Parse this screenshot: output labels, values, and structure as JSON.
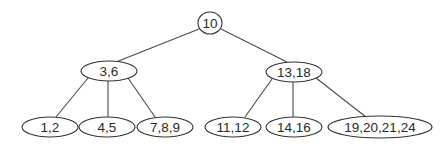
{
  "diagram": {
    "type": "b-tree",
    "colors": {
      "background": "#ffffff",
      "stroke": "#333333",
      "text": "#2a2a2a"
    },
    "nodes": [
      {
        "id": "root",
        "label": "10",
        "shape": "circle",
        "cx": 210,
        "cy": 23,
        "rx": 12,
        "ry": 11
      },
      {
        "id": "n36",
        "label": "3,6",
        "shape": "ellipse",
        "cx": 109,
        "cy": 71,
        "rx": 28,
        "ry": 10
      },
      {
        "id": "n1318",
        "label": "13,18",
        "shape": "ellipse",
        "cx": 294,
        "cy": 72,
        "rx": 28,
        "ry": 10
      },
      {
        "id": "n12",
        "label": "1,2",
        "shape": "ellipse",
        "cx": 50,
        "cy": 127,
        "rx": 28,
        "ry": 10
      },
      {
        "id": "n45",
        "label": "4,5",
        "shape": "ellipse",
        "cx": 107,
        "cy": 127,
        "rx": 28,
        "ry": 10
      },
      {
        "id": "n789",
        "label": "7,8,9",
        "shape": "ellipse",
        "cx": 165,
        "cy": 127,
        "rx": 28,
        "ry": 10
      },
      {
        "id": "n1112",
        "label": "11,12",
        "shape": "ellipse",
        "cx": 233,
        "cy": 127,
        "rx": 28,
        "ry": 10
      },
      {
        "id": "n1416",
        "label": "14,16",
        "shape": "ellipse",
        "cx": 294,
        "cy": 127,
        "rx": 28,
        "ry": 10
      },
      {
        "id": "n19202124",
        "label": "19,20,21,24",
        "shape": "ellipse",
        "cx": 380,
        "cy": 127,
        "rx": 52,
        "ry": 11
      }
    ],
    "edges": [
      {
        "from": "root",
        "to": "n36",
        "x1": 199,
        "y1": 29,
        "x2": 116,
        "y2": 62
      },
      {
        "from": "root",
        "to": "n1318",
        "x1": 221,
        "y1": 29,
        "x2": 287,
        "y2": 62
      },
      {
        "from": "n36",
        "to": "n12",
        "x1": 88,
        "y1": 78,
        "x2": 56,
        "y2": 117
      },
      {
        "from": "n36",
        "to": "n45",
        "x1": 108,
        "y1": 81,
        "x2": 108,
        "y2": 117
      },
      {
        "from": "n36",
        "to": "n789",
        "x1": 128,
        "y1": 78,
        "x2": 155,
        "y2": 117
      },
      {
        "from": "n1318",
        "to": "n1112",
        "x1": 272,
        "y1": 79,
        "x2": 245,
        "y2": 117
      },
      {
        "from": "n1318",
        "to": "n1416",
        "x1": 293,
        "y1": 82,
        "x2": 293,
        "y2": 117
      },
      {
        "from": "n1318",
        "to": "n19202124",
        "x1": 316,
        "y1": 78,
        "x2": 366,
        "y2": 117
      }
    ]
  }
}
